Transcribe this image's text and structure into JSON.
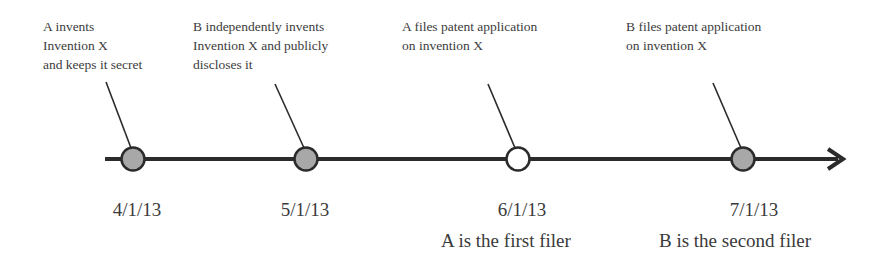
{
  "timeline": {
    "colors": {
      "axis": "#2b2b2b",
      "filled_node": "#a8a8a8",
      "open_node": "#ffffff",
      "stroke": "#2b2b2b"
    },
    "events": [
      {
        "caption": "A invents\nInvention X\nand keeps it secret",
        "date": "4/1/13",
        "node": "filled"
      },
      {
        "caption": "B independently invents\nInvention X and publicly\ndiscloses it",
        "date": "5/1/13",
        "node": "filled"
      },
      {
        "caption": "A files patent application\non invention X",
        "date": "6/1/13",
        "node": "open"
      },
      {
        "caption": "B files patent application\non invention X",
        "date": "7/1/13",
        "node": "filled"
      }
    ],
    "notes": [
      {
        "text": "A is the first filer",
        "under_event": 2
      },
      {
        "text": "B is the second filer",
        "under_event": 3
      }
    ]
  }
}
